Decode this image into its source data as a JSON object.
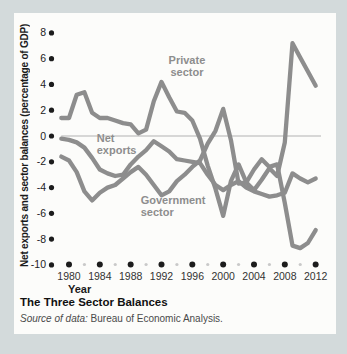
{
  "figure": {
    "title": "The Three Sector Balances",
    "source_prefix": "Source of data:",
    "source_text": " Bureau of Economic Analysis."
  },
  "chart_data": {
    "type": "line",
    "title": "The Three Sector Balances",
    "xlabel": "Year",
    "ylabel": "Net exports and sector balances (percentage of GDP)",
    "xlim": [
      1979,
      2012
    ],
    "ylim": [
      -10,
      8
    ],
    "y_ticks": [
      8,
      6,
      4,
      2,
      0,
      -2,
      -4,
      -6,
      -8,
      -10
    ],
    "x_ticks_major": [
      1980,
      1984,
      1988,
      1992,
      1996,
      2000,
      2004,
      2008,
      2012
    ],
    "x_ticks_minor": [
      1982,
      1986,
      1990,
      1994,
      1998,
      2002,
      2006,
      2010
    ],
    "zero_line": true,
    "legend": "inline-labels",
    "x": [
      1979,
      1980,
      1981,
      1982,
      1983,
      1984,
      1985,
      1986,
      1987,
      1988,
      1989,
      1990,
      1991,
      1992,
      1993,
      1994,
      1995,
      1996,
      1997,
      1998,
      1999,
      2000,
      2001,
      2002,
      2003,
      2004,
      2005,
      2006,
      2007,
      2008,
      2009,
      2010,
      2011,
      2012
    ],
    "series": [
      {
        "name": "Private sector",
        "label_lines": [
          "Private",
          "sector"
        ],
        "label_pos": {
          "year": 1995.3,
          "value": 5.6,
          "anchor": "middle"
        },
        "values": [
          1.4,
          1.4,
          3.2,
          3.4,
          1.8,
          1.4,
          1.4,
          1.2,
          1.0,
          0.9,
          0.2,
          0.5,
          2.7,
          4.2,
          3.0,
          1.9,
          1.8,
          1.2,
          -0.2,
          -2.3,
          -4.1,
          -6.2,
          -3.5,
          -2.2,
          -3.6,
          -4.2,
          -3.4,
          -2.5,
          -3.1,
          -0.5,
          7.2,
          6.1,
          5.0,
          3.9
        ]
      },
      {
        "name": "Net exports",
        "label_lines": [
          "Net",
          "exports"
        ],
        "label_pos": {
          "year": 1983.6,
          "value": -0.5,
          "anchor": "start"
        },
        "values": [
          -0.2,
          -0.3,
          -0.5,
          -0.9,
          -1.7,
          -2.6,
          -2.9,
          -3.1,
          -3.0,
          -2.2,
          -1.6,
          -1.1,
          -0.4,
          -0.8,
          -1.2,
          -1.8,
          -1.9,
          -2.0,
          -2.1,
          -3.0,
          -3.8,
          -4.2,
          -3.8,
          -3.5,
          -4.0,
          -4.3,
          -4.5,
          -4.7,
          -4.6,
          -4.4,
          -2.9,
          -3.3,
          -3.6,
          -3.3
        ]
      },
      {
        "name": "Government sector",
        "label_lines": [
          "Government",
          "sector"
        ],
        "label_pos": {
          "year": 1989.3,
          "value": -5.3,
          "anchor": "start"
        },
        "values": [
          -1.6,
          -1.9,
          -2.8,
          -4.3,
          -5.0,
          -4.4,
          -4.0,
          -3.8,
          -3.3,
          -2.8,
          -2.4,
          -3.0,
          -3.8,
          -4.6,
          -4.3,
          -3.5,
          -3.0,
          -2.4,
          -1.9,
          -0.6,
          0.4,
          2.1,
          -0.3,
          -3.7,
          -3.6,
          -2.6,
          -1.8,
          -2.4,
          -2.2,
          -5.2,
          -8.5,
          -8.7,
          -8.3,
          -7.3
        ]
      }
    ],
    "colors": {
      "line": "#8d8d8d",
      "series_label": "#8d8d8d",
      "tick_dot": "#1c1c1c",
      "minor_tick_dot": "#c9c9c9",
      "zero_line": "#b2b2b2",
      "tick_label": "#333333",
      "panel_bg": "#fcfcfa",
      "page_bg": "#d3dadb"
    }
  }
}
